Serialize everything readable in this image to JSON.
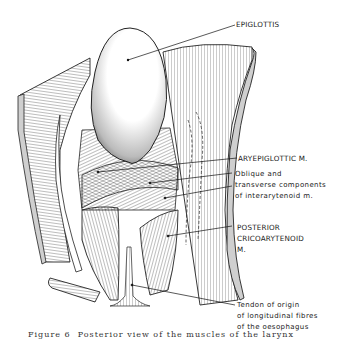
{
  "figure": {
    "labels": {
      "epiglottis": "EPIGLOTTIS",
      "aryepiglottic": "ARYEPIGLOTTIC M.",
      "oblique_line1": "Oblique and",
      "oblique_line2": "transverse components",
      "oblique_line3": "of interarytenoid m.",
      "posterior_line1": "POSTERIOR",
      "posterior_line2": "CRICOARYTENOID",
      "posterior_line3": "M.",
      "tendon_line1": "Tendon of origin",
      "tendon_line2": "of longitudinal fibres",
      "tendon_line3": "of the oesophagus"
    },
    "caption": "Figure 6  Posterior view of the muscles of the larynx"
  }
}
